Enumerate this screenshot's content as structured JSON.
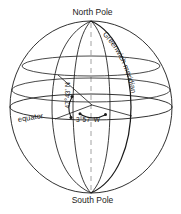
{
  "figure": {
    "name": "globe-coordinate-diagram",
    "labels": {
      "north_pole": "North Pole",
      "south_pole": "South Pole",
      "equator": "equator",
      "greenwich_meridian": "Greenwich meridian",
      "latitude": "47°43' N",
      "longitude": "3°57' W"
    },
    "colors": {
      "background": "#ffffff",
      "stroke": "#1a1a1a",
      "axis_dash": "#8a8a8a",
      "text": "#1a1a1a"
    },
    "geometry": {
      "center_x": 91,
      "center_y": 107,
      "radius_x": 81,
      "radius_y": 86,
      "north_pole_x": 91,
      "north_pole_y": 21,
      "south_pole_x": 91,
      "south_pole_y": 193,
      "equator_ry": 13,
      "latitude_rings": [
        {
          "cy": 66,
          "rx": 69,
          "ry": 10
        },
        {
          "cy": 90,
          "rx": 79,
          "ry": 12
        }
      ],
      "vertex_x": 92,
      "vertex_y": 105
    }
  }
}
